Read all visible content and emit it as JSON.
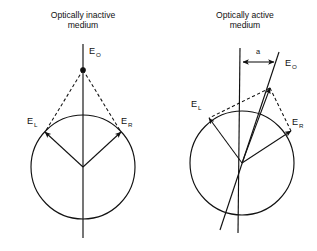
{
  "figure": {
    "background_color": "#ffffff",
    "ink_color": "#111111",
    "panels": [
      {
        "id": "left",
        "title_line1": "Optically inactive",
        "title_line2": "medium",
        "resultant_label": "E",
        "resultant_sub": "O",
        "left_vector_label": "E",
        "left_vector_sub": "L",
        "right_vector_label": "E",
        "right_vector_sub": "R",
        "circle": {
          "cx": 83,
          "cy": 167,
          "r": 52
        },
        "apex": {
          "x": 83,
          "y": 70
        },
        "vector_left_tip": {
          "x": 44,
          "y": 133
        },
        "vector_right_tip": {
          "x": 122,
          "y": 133
        },
        "axis_top": {
          "x": 83,
          "y": 44
        },
        "axis_bottom": {
          "x": 83,
          "y": 238
        },
        "has_apex_dot": true,
        "tilt_degrees": 0
      },
      {
        "id": "right",
        "title_line1": "Optically active",
        "title_line2": "medium",
        "resultant_label": "E",
        "resultant_sub": "O",
        "left_vector_label": "E",
        "left_vector_sub": "L",
        "right_vector_label": "E",
        "right_vector_sub": "R",
        "rotation_label": "a",
        "circle": {
          "cx": 242,
          "cy": 163,
          "r": 52
        },
        "apex": {
          "x": 270,
          "y": 88
        },
        "vector_left_tip": {
          "x": 208,
          "y": 119
        },
        "vector_right_tip": {
          "x": 292,
          "y": 133
        },
        "axis_top": {
          "x": 240,
          "y": 48
        },
        "axis_bottom": {
          "x": 238,
          "y": 233
        },
        "tilted_top": {
          "x": 279,
          "y": 52
        },
        "tilted_bottom": {
          "x": 220,
          "y": 230
        },
        "arrow_span_left": {
          "x": 243,
          "y": 62
        },
        "arrow_span_right": {
          "x": 274,
          "y": 62
        },
        "has_apex_dot": false,
        "tilt_degrees": 18
      }
    ]
  }
}
